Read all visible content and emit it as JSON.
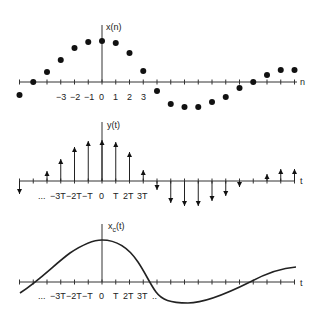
{
  "figure": {
    "panels": [
      {
        "id": "discrete",
        "title": "x(n)",
        "axis_label": "n",
        "tick_labels": [
          "-3",
          "-2",
          "-1",
          "0",
          "1",
          "2",
          "3"
        ],
        "type": "dots"
      },
      {
        "id": "impulses",
        "title": "y(t)",
        "axis_label": "t",
        "tick_labels": [
          "...",
          "-3T",
          "-2T",
          "-T",
          "0",
          "T",
          "2T",
          "3T"
        ],
        "type": "impulse-train"
      },
      {
        "id": "continuous",
        "title": "x_c(t)",
        "title_main": "x",
        "title_sub": "c",
        "title_rest": "(t)",
        "axis_label": "t",
        "tick_labels": [
          "...",
          "-3T",
          "-2T",
          "-T",
          "0",
          "T",
          "2T",
          "3T",
          "..."
        ],
        "type": "curve"
      }
    ]
  },
  "chart_data": {
    "type": "scatter",
    "n": [
      -6,
      -5,
      -4,
      -3,
      -2,
      -1,
      0,
      1,
      2,
      3,
      4,
      5,
      6,
      7,
      8,
      9,
      10,
      11,
      12,
      13,
      14
    ],
    "values": [
      -13,
      0,
      10,
      22,
      34,
      40,
      41,
      39,
      29,
      11,
      -9,
      -22,
      -25,
      -25,
      -20,
      -15,
      -6,
      0,
      7,
      12,
      12
    ],
    "xlabel": "n",
    "ylabel": "x(n)"
  },
  "labels": {
    "top_title": "x(n)",
    "top_axis": "n",
    "mid_title": "y(t)",
    "mid_axis": "t",
    "bot_axis": "t",
    "bot_title_main": "x",
    "bot_title_sub": "c",
    "bot_title_rest": "(t)",
    "top_ticks": [
      "−3",
      "−2",
      "−1",
      "0",
      "1",
      "2",
      "3"
    ],
    "mid_ticks": [
      "...",
      "−3T",
      "−2T",
      "−T",
      "0",
      "T",
      "2T",
      "3T"
    ],
    "bot_ticks": [
      "...",
      "−3T",
      "−2T",
      "−T",
      "0",
      "T",
      "2T",
      "3T",
      ".."
    ]
  }
}
